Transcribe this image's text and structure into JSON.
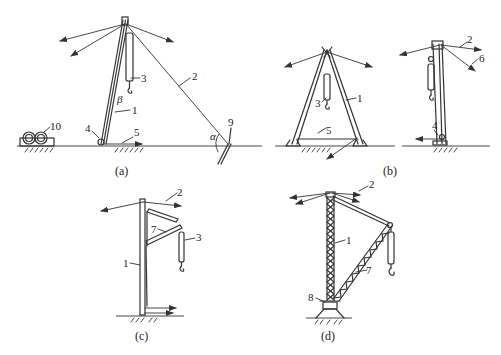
{
  "figure": {
    "panels": [
      {
        "id": "a",
        "caption": "(a)",
        "labels": {
          "mast": "1",
          "guy_rope": "2",
          "pulley_block": "3",
          "guide_pulley": "4",
          "hoist_rope": "5",
          "anchor": "9",
          "winch": "10",
          "alpha": "α",
          "beta": "β"
        }
      },
      {
        "id": "b",
        "caption": "(b)",
        "labels": {
          "mast": "1",
          "pulley_block": "3",
          "tie_bar": "5",
          "guy_rope": "2",
          "guide_pulley": "4",
          "rope_6": "6"
        }
      },
      {
        "id": "c",
        "caption": "(c)",
        "labels": {
          "mast": "1",
          "guy_rope": "2",
          "pulley_block": "3",
          "boom": "7"
        }
      },
      {
        "id": "d",
        "caption": "(d)",
        "labels": {
          "mast": "1",
          "guy_rope": "2",
          "boom": "7",
          "base": "8"
        }
      }
    ]
  }
}
